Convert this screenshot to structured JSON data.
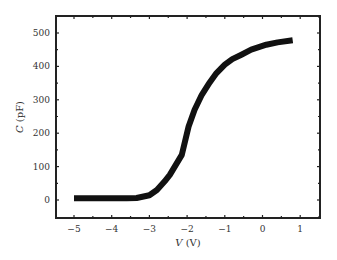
{
  "chart_data": {
    "type": "line",
    "title": "",
    "xlabel": "V (V)",
    "ylabel": "C (pF)",
    "xlim": [
      -5.5,
      1.5
    ],
    "ylim": [
      -50,
      550
    ],
    "xticks": [
      -5,
      -4,
      -3,
      -2,
      -1,
      0,
      1
    ],
    "yticks": [
      0,
      100,
      200,
      300,
      400,
      500
    ],
    "grid": false,
    "legend": null,
    "series": [
      {
        "name": "C-V",
        "color": "#111111",
        "x": [
          -5.0,
          -4.5,
          -4.0,
          -3.6,
          -3.34,
          -3.0,
          -2.8,
          -2.6,
          -2.46,
          -2.3,
          -2.14,
          -1.96,
          -1.8,
          -1.61,
          -1.4,
          -1.22,
          -1.0,
          -0.8,
          -0.56,
          -0.3,
          0.1,
          0.4,
          0.8
        ],
        "y": [
          5,
          5,
          5,
          5,
          6,
          14,
          30,
          55,
          75,
          105,
          135,
          220,
          270,
          315,
          352,
          380,
          405,
          422,
          435,
          450,
          465,
          472,
          478
        ]
      }
    ]
  }
}
